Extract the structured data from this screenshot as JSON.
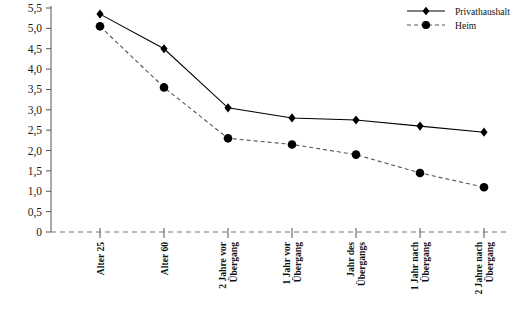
{
  "chart_data": {
    "type": "line",
    "title": "",
    "xlabel": "",
    "ylabel": "",
    "ylim": [
      0,
      5.5
    ],
    "yticks": [
      0,
      0.5,
      1.0,
      1.5,
      2.0,
      2.5,
      3.0,
      3.5,
      4.0,
      4.5,
      5.0,
      5.5
    ],
    "ytick_labels": [
      "0",
      "0,5",
      "1,0",
      "1,5",
      "2,0",
      "2,5",
      "3,0",
      "3,5",
      "4,0",
      "4,5",
      "5,0",
      "5,5"
    ],
    "grid": false,
    "legend_position": "top-right",
    "categories": [
      "Alter 25",
      "Alter 60",
      "2 Jahre vor Übergang",
      "1 Jahr vor Übergang",
      "Jahr des Übergangs",
      "1 Jahr nach Übergang",
      "2 Jahre nach Übergang"
    ],
    "categories_lines": [
      [
        "Alter 25"
      ],
      [
        "Alter 60"
      ],
      [
        "2 Jahre vor",
        "Übergang"
      ],
      [
        "1 Jahr vor",
        "Übergang"
      ],
      [
        "Jahr des",
        "Übergangs"
      ],
      [
        "1 Jahr nach",
        "Übergang"
      ],
      [
        "2 Jahre nach",
        "Übergang"
      ]
    ],
    "series": [
      {
        "name": "Privathaushalt",
        "marker": "diamond",
        "linestyle": "solid",
        "color": "#000000",
        "values": [
          5.35,
          4.5,
          3.05,
          2.8,
          2.75,
          2.6,
          2.45
        ]
      },
      {
        "name": "Heim",
        "marker": "circle",
        "linestyle": "dashed",
        "color": "#000000",
        "values": [
          5.05,
          3.55,
          2.3,
          2.15,
          1.9,
          1.45,
          1.1
        ]
      }
    ]
  },
  "legend": {
    "items": [
      {
        "label": "Privathaushalt",
        "marker": "diamond",
        "linestyle": "solid"
      },
      {
        "label": "Heim",
        "marker": "circle",
        "linestyle": "dashed"
      }
    ]
  }
}
